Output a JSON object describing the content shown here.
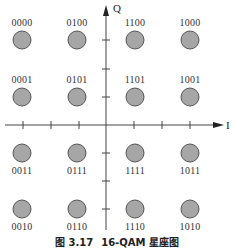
{
  "figure": {
    "caption_number": "图 3.17",
    "caption_title": "16-QAM 星座图",
    "axes": {
      "x_label": "I",
      "y_label": "Q"
    },
    "colors": {
      "point_fill": "#a6a6a6",
      "point_stroke": "#555555",
      "axis": "#444444"
    },
    "points": [
      {
        "label": "0000",
        "col": 0,
        "row": 0
      },
      {
        "label": "0100",
        "col": 1,
        "row": 0
      },
      {
        "label": "1100",
        "col": 2,
        "row": 0
      },
      {
        "label": "1000",
        "col": 3,
        "row": 0
      },
      {
        "label": "0001",
        "col": 0,
        "row": 1
      },
      {
        "label": "0101",
        "col": 1,
        "row": 1
      },
      {
        "label": "1101",
        "col": 2,
        "row": 1
      },
      {
        "label": "1001",
        "col": 3,
        "row": 1
      },
      {
        "label": "0011",
        "col": 0,
        "row": 2
      },
      {
        "label": "0111",
        "col": 1,
        "row": 2
      },
      {
        "label": "1111",
        "col": 2,
        "row": 2
      },
      {
        "label": "1011",
        "col": 3,
        "row": 2
      },
      {
        "label": "0010",
        "col": 0,
        "row": 3
      },
      {
        "label": "0110",
        "col": 1,
        "row": 3
      },
      {
        "label": "1110",
        "col": 2,
        "row": 3
      },
      {
        "label": "1010",
        "col": 3,
        "row": 3
      }
    ]
  }
}
